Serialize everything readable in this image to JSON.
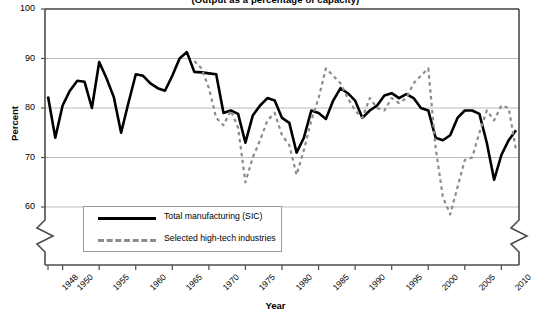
{
  "title": "(Output as a percentage of capacity)",
  "axes": {
    "ylabel": "Percent",
    "xlabel": "Year",
    "yticks": [
      "100",
      "90",
      "80",
      "70",
      "60"
    ],
    "xticks": [
      "1948",
      "1950",
      "1955",
      "1960",
      "1965",
      "1970",
      "1975",
      "1980",
      "1985",
      "1990",
      "1995",
      "2000",
      "2005",
      "2010"
    ]
  },
  "legend": {
    "items": [
      {
        "label": "Total manufacturing (SIC)",
        "style": "solid",
        "color": "#000000"
      },
      {
        "label": "Selected high-tech industries",
        "style": "dashed",
        "color": "#8c8c8c"
      }
    ]
  },
  "colors": {
    "manufacturing": "#000000",
    "hightech": "#8c8c8c",
    "grid": "#aaaaaa",
    "axis": "#4d4d4d"
  },
  "chart_data": {
    "type": "line",
    "title": "(Output as a percentage of capacity)",
    "xlabel": "Year",
    "ylabel": "Percent",
    "xlim": [
      1948,
      2012
    ],
    "ylim": [
      57,
      100
    ],
    "yticks": [
      60,
      70,
      80,
      90,
      100
    ],
    "grid": "horizontal",
    "axis_break": "y-axis broken below 60",
    "legend_position": "bottom-left-inside",
    "series": [
      {
        "name": "Total manufacturing (SIC)",
        "style": "solid",
        "color": "#000000",
        "x": [
          1948,
          1949,
          1950,
          1951,
          1952,
          1953,
          1954,
          1955,
          1956,
          1957,
          1958,
          1959,
          1960,
          1961,
          1962,
          1963,
          1964,
          1965,
          1966,
          1967,
          1968,
          1969,
          1970,
          1971,
          1972,
          1973,
          1974,
          1975,
          1976,
          1977,
          1978,
          1979,
          1980,
          1981,
          1982,
          1983,
          1984,
          1985,
          1986,
          1987,
          1988,
          1989,
          1990,
          1991,
          1992,
          1993,
          1994,
          1995,
          1996,
          1997,
          1998,
          1999,
          2000,
          2001,
          2002,
          2003,
          2004,
          2005,
          2006,
          2007,
          2008,
          2009,
          2010,
          2011,
          2012
        ],
        "y": [
          82.3,
          74.0,
          80.5,
          83.5,
          85.5,
          85.3,
          80.0,
          89.3,
          86.0,
          82.2,
          75.0,
          81.0,
          86.8,
          86.5,
          85.0,
          84.0,
          83.5,
          86.5,
          90.0,
          91.3,
          87.3,
          87.2,
          87.0,
          86.8,
          79.0,
          79.5,
          78.8,
          73.0,
          78.5,
          80.5,
          82.0,
          81.5,
          78.0,
          77.0,
          71.0,
          74.0,
          79.5,
          79.0,
          77.8,
          81.5,
          84.0,
          83.0,
          81.5,
          78.0,
          79.5,
          80.5,
          82.5,
          83.0,
          82.0,
          82.8,
          82.0,
          80.0,
          79.5,
          74.0,
          73.5,
          74.5,
          78.0,
          79.5,
          79.5,
          78.8,
          73.0,
          65.5,
          70.5,
          73.5,
          75.5
        ]
      },
      {
        "name": "Selected high-tech industries",
        "style": "dashed",
        "color": "#8c8c8c",
        "x": [
          1968,
          1969,
          1970,
          1971,
          1972,
          1973,
          1974,
          1975,
          1976,
          1977,
          1978,
          1979,
          1980,
          1981,
          1982,
          1983,
          1984,
          1985,
          1986,
          1987,
          1988,
          1989,
          1990,
          1991,
          1992,
          1993,
          1994,
          1995,
          1996,
          1997,
          1998,
          1999,
          2000,
          2001,
          2002,
          2003,
          2004,
          2005,
          2006,
          2007,
          2008,
          2009,
          2010,
          2011,
          2012
        ],
        "y": [
          89.5,
          88.0,
          84.0,
          78.0,
          76.5,
          79.5,
          76.0,
          65.0,
          70.0,
          73.5,
          77.5,
          79.0,
          74.5,
          72.5,
          66.5,
          71.5,
          77.5,
          82.0,
          88.0,
          86.5,
          85.0,
          82.0,
          79.5,
          78.0,
          82.0,
          80.0,
          79.5,
          82.0,
          81.0,
          82.0,
          85.0,
          86.5,
          88.0,
          72.0,
          62.0,
          58.5,
          64.0,
          69.5,
          70.0,
          75.0,
          79.5,
          77.5,
          80.5,
          80.0,
          71.5
        ]
      }
    ]
  }
}
